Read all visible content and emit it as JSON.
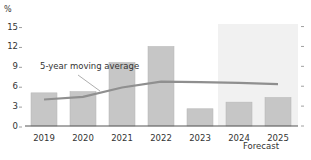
{
  "chart_data": {
    "type": "bar",
    "title": "",
    "xlabel": "",
    "ylabel": "%",
    "ylim": [
      0,
      15
    ],
    "yticks": [
      0,
      3,
      6,
      9,
      12,
      15
    ],
    "categories": [
      "2019",
      "2020",
      "2021",
      "2022",
      "2023",
      "2024",
      "2025"
    ],
    "series": [
      {
        "name": "Annual value",
        "type": "bar",
        "color": "#c6c6c6",
        "values": [
          5.0,
          5.2,
          9.6,
          12.0,
          2.6,
          3.6,
          4.3
        ]
      },
      {
        "name": "5-year moving average",
        "type": "line",
        "color": "#8f8f8f",
        "values": [
          4.0,
          4.4,
          5.8,
          6.7,
          6.6,
          6.5,
          6.3
        ]
      }
    ],
    "annotations": [
      {
        "text": "5-year moving average",
        "target_series": "5-year moving average"
      },
      {
        "text": "Forecast",
        "x_range": [
          "2024",
          "2025"
        ],
        "shaded": true,
        "shade_color": "#f1f1f1"
      }
    ],
    "grid": false,
    "legend": "none"
  },
  "labels": {
    "y_unit": "%",
    "moving_average": "5-year moving average",
    "forecast": "Forecast"
  }
}
